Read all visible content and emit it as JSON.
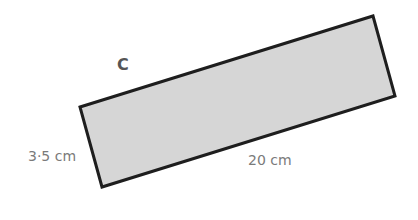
{
  "diagram": {
    "shape_label": "C",
    "shape": "rectangle",
    "fill_color": "#d6d6d6",
    "stroke_color": "#1e1e1e",
    "label_color": "#7a7a7a",
    "shape_label_color": "#555555",
    "corners": [
      [
        80,
        107
      ],
      [
        373,
        16
      ],
      [
        395,
        96
      ],
      [
        102,
        187
      ]
    ],
    "dimensions": {
      "width_label": "3·5 cm",
      "length_label": "20 cm"
    }
  }
}
